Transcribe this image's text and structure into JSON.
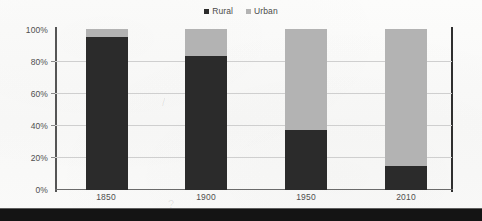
{
  "chart_data": {
    "type": "bar",
    "subtype": "stacked-100-percent",
    "title": "",
    "xlabel": "",
    "ylabel": "",
    "categories": [
      "1850",
      "1900",
      "1950",
      "2010"
    ],
    "series": [
      {
        "name": "Rural",
        "color": "#2b2b2b",
        "values": [
          95,
          83,
          37,
          15
        ]
      },
      {
        "name": "Urban",
        "color": "#b3b3b3",
        "values": [
          5,
          17,
          63,
          85
        ]
      }
    ],
    "ylim": [
      0,
      100
    ],
    "yticks": [
      0,
      20,
      40,
      60,
      80,
      100
    ],
    "ytick_labels": [
      "0%",
      "20%",
      "40%",
      "60%",
      "80%",
      "100%"
    ],
    "grid": "horizontal",
    "legend_position": "top-center",
    "annotations": []
  },
  "legend": {
    "items": [
      {
        "label": "Rural",
        "swatch": "square-dark",
        "color": "#2b2b2b"
      },
      {
        "label": "Urban",
        "swatch": "square-gray",
        "color": "#b3b3b3"
      }
    ]
  },
  "axes": {
    "y": {
      "ticks": [
        {
          "label": "100%",
          "value": 100
        },
        {
          "label": "80%",
          "value": 80
        },
        {
          "label": "60%",
          "value": 60
        },
        {
          "label": "40%",
          "value": 40
        },
        {
          "label": "20%",
          "value": 20
        },
        {
          "label": "0%",
          "value": 0
        }
      ]
    },
    "x": {
      "ticks": [
        {
          "label": "1850"
        },
        {
          "label": "1900"
        },
        {
          "label": "1950"
        },
        {
          "label": "2010"
        }
      ]
    }
  }
}
